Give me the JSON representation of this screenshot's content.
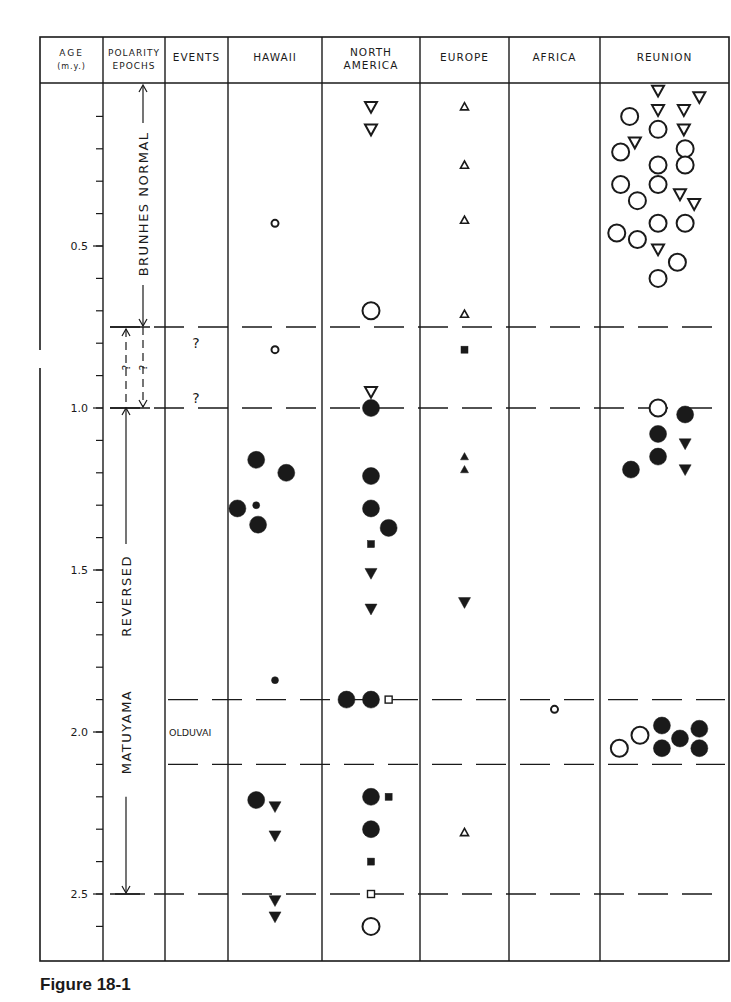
{
  "caption": "Figure 18-1",
  "chart_data": {
    "type": "scatter",
    "title": "Figure 18-1",
    "ylabel": "AGE (m.y.)",
    "ylim": [
      0,
      2.7
    ],
    "y_axis_inverted": true,
    "y_ticks_major": [
      0.5,
      1.0,
      1.5,
      2.0,
      2.5
    ],
    "y_tick_labels": [
      "0.5",
      "1.0",
      "1.5",
      "2.0",
      "2.5"
    ],
    "y_ticks_minor_step": 0.1,
    "columns": [
      {
        "key": "age",
        "label_lines": [
          "AGE",
          "(m.y.)"
        ]
      },
      {
        "key": "polarity",
        "label_lines": [
          "POLARITY",
          "EPOCHS"
        ]
      },
      {
        "key": "events",
        "label_lines": [
          "EVENTS"
        ]
      },
      {
        "key": "hawaii",
        "label_lines": [
          "HAWAII"
        ]
      },
      {
        "key": "north_america",
        "label_lines": [
          "NORTH",
          "AMERICA"
        ]
      },
      {
        "key": "europe",
        "label_lines": [
          "EUROPE"
        ]
      },
      {
        "key": "africa",
        "label_lines": [
          "AFRICA"
        ]
      },
      {
        "key": "reunion",
        "label_lines": [
          "REUNION"
        ]
      }
    ],
    "boundaries": [
      {
        "age": 0.75,
        "label": "Brunhes/Matuyama (uncertain)"
      },
      {
        "age": 1.0,
        "label": ""
      },
      {
        "age": 1.9,
        "label": "Olduvai top"
      },
      {
        "age": 2.1,
        "label": "Olduvai base"
      },
      {
        "age": 2.5,
        "label": "Matuyama base"
      }
    ],
    "epochs": [
      {
        "name": "BRUNHES NORMAL",
        "from": 0,
        "to": 0.75
      },
      {
        "name": "MATUYAMA REVERSED",
        "from": 0.75,
        "to": 2.5
      }
    ],
    "events": [
      {
        "label": "?",
        "age": 0.82
      },
      {
        "label": "?",
        "age": 0.99
      },
      {
        "label": "OLDUVAI",
        "age": 2.0
      }
    ],
    "legend_note": "open = normal polarity, filled = reversed polarity; circle/triangle/square indicate dating method/size",
    "series": [
      {
        "name": "Hawaii",
        "points": [
          {
            "age": 0.43,
            "x": 0.5,
            "shape": "circle",
            "size": "small",
            "fill": "open"
          },
          {
            "age": 0.82,
            "x": 0.5,
            "shape": "circle",
            "size": "small",
            "fill": "open"
          },
          {
            "age": 1.16,
            "x": 0.3,
            "shape": "circle",
            "size": "large",
            "fill": "filled"
          },
          {
            "age": 1.2,
            "x": 0.62,
            "shape": "circle",
            "size": "large",
            "fill": "filled"
          },
          {
            "age": 1.31,
            "x": 0.1,
            "shape": "circle",
            "size": "large",
            "fill": "filled"
          },
          {
            "age": 1.3,
            "x": 0.3,
            "shape": "circle",
            "size": "small",
            "fill": "filled"
          },
          {
            "age": 1.36,
            "x": 0.32,
            "shape": "circle",
            "size": "large",
            "fill": "filled"
          },
          {
            "age": 1.84,
            "x": 0.5,
            "shape": "circle",
            "size": "small",
            "fill": "filled"
          },
          {
            "age": 2.21,
            "x": 0.3,
            "shape": "circle",
            "size": "large",
            "fill": "filled"
          },
          {
            "age": 2.23,
            "x": 0.5,
            "shape": "triangle-down",
            "size": "medium",
            "fill": "filled"
          },
          {
            "age": 2.32,
            "x": 0.5,
            "shape": "triangle-down",
            "size": "medium",
            "fill": "filled"
          },
          {
            "age": 2.52,
            "x": 0.5,
            "shape": "triangle-down",
            "size": "medium",
            "fill": "filled"
          },
          {
            "age": 2.57,
            "x": 0.5,
            "shape": "triangle-down",
            "size": "medium",
            "fill": "filled"
          }
        ]
      },
      {
        "name": "North America",
        "points": [
          {
            "age": 0.07,
            "x": 0.5,
            "shape": "triangle-down",
            "size": "medium",
            "fill": "open"
          },
          {
            "age": 0.14,
            "x": 0.5,
            "shape": "triangle-down",
            "size": "medium",
            "fill": "open"
          },
          {
            "age": 0.7,
            "x": 0.5,
            "shape": "circle",
            "size": "large",
            "fill": "open"
          },
          {
            "age": 0.95,
            "x": 0.5,
            "shape": "triangle-down",
            "size": "medium",
            "fill": "open"
          },
          {
            "age": 1.0,
            "x": 0.5,
            "shape": "circle",
            "size": "large",
            "fill": "filled"
          },
          {
            "age": 1.21,
            "x": 0.5,
            "shape": "circle",
            "size": "large",
            "fill": "filled"
          },
          {
            "age": 1.31,
            "x": 0.5,
            "shape": "circle",
            "size": "large",
            "fill": "filled"
          },
          {
            "age": 1.37,
            "x": 0.68,
            "shape": "circle",
            "size": "large",
            "fill": "filled"
          },
          {
            "age": 1.42,
            "x": 0.5,
            "shape": "square",
            "size": "small",
            "fill": "filled"
          },
          {
            "age": 1.51,
            "x": 0.5,
            "shape": "triangle-down",
            "size": "medium",
            "fill": "filled"
          },
          {
            "age": 1.62,
            "x": 0.5,
            "shape": "triangle-down",
            "size": "medium",
            "fill": "filled"
          },
          {
            "age": 1.9,
            "x": 0.25,
            "shape": "circle",
            "size": "large",
            "fill": "filled"
          },
          {
            "age": 1.9,
            "x": 0.5,
            "shape": "circle",
            "size": "large",
            "fill": "filled"
          },
          {
            "age": 1.9,
            "x": 0.68,
            "shape": "square",
            "size": "small",
            "fill": "open"
          },
          {
            "age": 2.2,
            "x": 0.5,
            "shape": "circle",
            "size": "large",
            "fill": "filled"
          },
          {
            "age": 2.2,
            "x": 0.68,
            "shape": "square",
            "size": "small",
            "fill": "filled"
          },
          {
            "age": 2.3,
            "x": 0.5,
            "shape": "circle",
            "size": "large",
            "fill": "filled"
          },
          {
            "age": 2.4,
            "x": 0.5,
            "shape": "square",
            "size": "small",
            "fill": "filled"
          },
          {
            "age": 2.5,
            "x": 0.5,
            "shape": "square",
            "size": "small",
            "fill": "open"
          },
          {
            "age": 2.6,
            "x": 0.5,
            "shape": "circle",
            "size": "large",
            "fill": "open"
          }
        ]
      },
      {
        "name": "Europe",
        "points": [
          {
            "age": 0.07,
            "x": 0.5,
            "shape": "triangle-up",
            "size": "small",
            "fill": "open"
          },
          {
            "age": 0.25,
            "x": 0.5,
            "shape": "triangle-up",
            "size": "small",
            "fill": "open"
          },
          {
            "age": 0.42,
            "x": 0.5,
            "shape": "triangle-up",
            "size": "small",
            "fill": "open"
          },
          {
            "age": 0.71,
            "x": 0.5,
            "shape": "triangle-up",
            "size": "small",
            "fill": "open"
          },
          {
            "age": 0.82,
            "x": 0.5,
            "shape": "square",
            "size": "small",
            "fill": "filled"
          },
          {
            "age": 1.15,
            "x": 0.5,
            "shape": "triangle-up",
            "size": "small",
            "fill": "filled"
          },
          {
            "age": 1.19,
            "x": 0.5,
            "shape": "triangle-up",
            "size": "small",
            "fill": "filled"
          },
          {
            "age": 1.6,
            "x": 0.5,
            "shape": "triangle-down",
            "size": "medium",
            "fill": "filled"
          },
          {
            "age": 2.31,
            "x": 0.5,
            "shape": "triangle-up",
            "size": "small",
            "fill": "open"
          }
        ]
      },
      {
        "name": "Africa",
        "points": [
          {
            "age": 1.93,
            "x": 0.5,
            "shape": "circle",
            "size": "small",
            "fill": "open"
          }
        ]
      },
      {
        "name": "Reunion",
        "points": [
          {
            "age": 0.02,
            "x": 0.45,
            "shape": "triangle-down",
            "size": "medium",
            "fill": "open"
          },
          {
            "age": 0.04,
            "x": 0.77,
            "shape": "triangle-down",
            "size": "medium",
            "fill": "open"
          },
          {
            "age": 0.08,
            "x": 0.45,
            "shape": "triangle-down",
            "size": "medium",
            "fill": "open"
          },
          {
            "age": 0.08,
            "x": 0.65,
            "shape": "triangle-down",
            "size": "medium",
            "fill": "open"
          },
          {
            "age": 0.1,
            "x": 0.23,
            "shape": "circle",
            "size": "large",
            "fill": "open"
          },
          {
            "age": 0.14,
            "x": 0.45,
            "shape": "circle",
            "size": "large",
            "fill": "open"
          },
          {
            "age": 0.14,
            "x": 0.65,
            "shape": "triangle-down",
            "size": "medium",
            "fill": "open"
          },
          {
            "age": 0.18,
            "x": 0.27,
            "shape": "triangle-down",
            "size": "medium",
            "fill": "open"
          },
          {
            "age": 0.21,
            "x": 0.16,
            "shape": "circle",
            "size": "large",
            "fill": "open"
          },
          {
            "age": 0.2,
            "x": 0.66,
            "shape": "circle",
            "size": "large",
            "fill": "open"
          },
          {
            "age": 0.25,
            "x": 0.45,
            "shape": "circle",
            "size": "large",
            "fill": "open"
          },
          {
            "age": 0.25,
            "x": 0.66,
            "shape": "circle",
            "size": "large",
            "fill": "open"
          },
          {
            "age": 0.31,
            "x": 0.16,
            "shape": "circle",
            "size": "large",
            "fill": "open"
          },
          {
            "age": 0.31,
            "x": 0.45,
            "shape": "circle",
            "size": "large",
            "fill": "open"
          },
          {
            "age": 0.34,
            "x": 0.62,
            "shape": "triangle-down",
            "size": "medium",
            "fill": "open"
          },
          {
            "age": 0.36,
            "x": 0.29,
            "shape": "circle",
            "size": "large",
            "fill": "open"
          },
          {
            "age": 0.37,
            "x": 0.73,
            "shape": "triangle-down",
            "size": "medium",
            "fill": "open"
          },
          {
            "age": 0.43,
            "x": 0.45,
            "shape": "circle",
            "size": "large",
            "fill": "open"
          },
          {
            "age": 0.43,
            "x": 0.66,
            "shape": "circle",
            "size": "large",
            "fill": "open"
          },
          {
            "age": 0.46,
            "x": 0.13,
            "shape": "circle",
            "size": "large",
            "fill": "open"
          },
          {
            "age": 0.48,
            "x": 0.29,
            "shape": "circle",
            "size": "large",
            "fill": "open"
          },
          {
            "age": 0.51,
            "x": 0.45,
            "shape": "triangle-down",
            "size": "medium",
            "fill": "open"
          },
          {
            "age": 0.55,
            "x": 0.6,
            "shape": "circle",
            "size": "large",
            "fill": "open"
          },
          {
            "age": 0.6,
            "x": 0.45,
            "shape": "circle",
            "size": "large",
            "fill": "open"
          },
          {
            "age": 1.0,
            "x": 0.45,
            "shape": "circle",
            "size": "large",
            "fill": "open"
          },
          {
            "age": 1.02,
            "x": 0.66,
            "shape": "circle",
            "size": "large",
            "fill": "filled"
          },
          {
            "age": 1.08,
            "x": 0.45,
            "shape": "circle",
            "size": "large",
            "fill": "filled"
          },
          {
            "age": 1.11,
            "x": 0.66,
            "shape": "triangle-down",
            "size": "medium",
            "fill": "filled"
          },
          {
            "age": 1.15,
            "x": 0.45,
            "shape": "circle",
            "size": "large",
            "fill": "filled"
          },
          {
            "age": 1.19,
            "x": 0.24,
            "shape": "circle",
            "size": "large",
            "fill": "filled"
          },
          {
            "age": 1.19,
            "x": 0.66,
            "shape": "triangle-down",
            "size": "medium",
            "fill": "filled"
          },
          {
            "age": 2.01,
            "x": 0.31,
            "shape": "circle",
            "size": "large",
            "fill": "open"
          },
          {
            "age": 2.05,
            "x": 0.15,
            "shape": "circle",
            "size": "large",
            "fill": "open"
          },
          {
            "age": 1.98,
            "x": 0.48,
            "shape": "circle",
            "size": "large",
            "fill": "filled"
          },
          {
            "age": 2.05,
            "x": 0.48,
            "shape": "circle",
            "size": "large",
            "fill": "filled"
          },
          {
            "age": 2.02,
            "x": 0.62,
            "shape": "circle",
            "size": "large",
            "fill": "filled"
          },
          {
            "age": 1.99,
            "x": 0.77,
            "shape": "circle",
            "size": "large",
            "fill": "filled"
          },
          {
            "age": 2.05,
            "x": 0.77,
            "shape": "circle",
            "size": "large",
            "fill": "filled"
          }
        ]
      }
    ]
  }
}
